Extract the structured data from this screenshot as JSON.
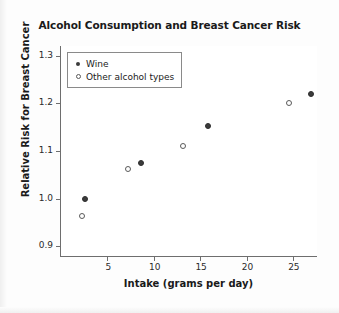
{
  "chart_data": {
    "type": "scatter",
    "title": "Alcohol Consumption and Breast Cancer Risk",
    "xlabel": "Intake (grams per day)",
    "ylabel": "Relative Risk for Breast Cancer",
    "xlim": [
      0,
      27.6
    ],
    "ylim": [
      0.88,
      1.32
    ],
    "xticks": [
      5,
      10,
      15,
      20,
      25
    ],
    "xticklabels": [
      "5",
      "10",
      "15",
      "20",
      "25"
    ],
    "yticks": [
      0.9,
      1.0,
      1.1,
      1.2,
      1.3
    ],
    "yticklabels": [
      "0.9",
      "1.0",
      "1.1",
      "1.2",
      "1.3"
    ],
    "grid": false,
    "legend_position": "upper-left",
    "series": [
      {
        "name": "Wine",
        "marker": "filled-circle",
        "color": "#3b3b3b",
        "points": [
          {
            "x": 2.6,
            "y": 1.0
          },
          {
            "x": 8.6,
            "y": 1.075
          },
          {
            "x": 15.8,
            "y": 1.152
          },
          {
            "x": 27.0,
            "y": 1.22
          }
        ]
      },
      {
        "name": "Other alcohol types",
        "marker": "open-circle",
        "color": "#ffffff",
        "points": [
          {
            "x": 2.3,
            "y": 0.963
          },
          {
            "x": 7.2,
            "y": 1.062
          },
          {
            "x": 13.2,
            "y": 1.11
          },
          {
            "x": 24.6,
            "y": 1.2
          }
        ]
      }
    ]
  },
  "legend": {
    "entries": [
      {
        "label": "Wine",
        "marker": "filled-circle"
      },
      {
        "label": "Other alcohol types",
        "marker": "open-circle"
      }
    ]
  },
  "colors": {
    "axis": "#6e6e6e",
    "text": "#1a1a1a",
    "marker_fill": "#3b3b3b",
    "marker_open_stroke": "#5a5a5a",
    "background": "#ffffff"
  }
}
